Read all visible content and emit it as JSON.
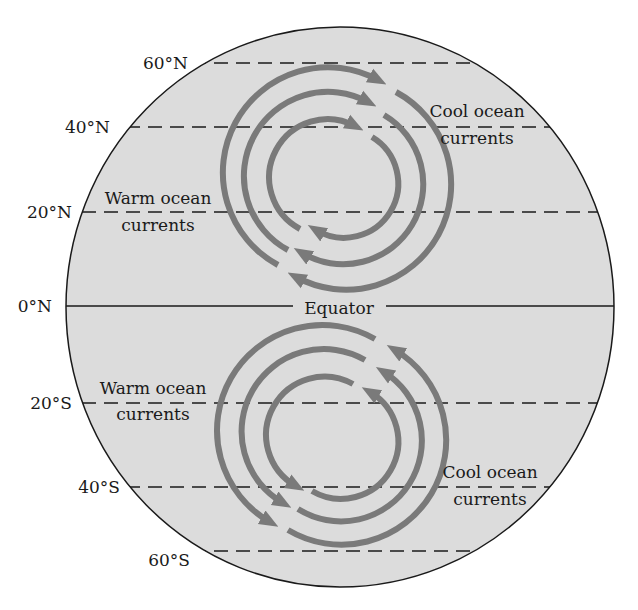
{
  "diagram": {
    "globe": {
      "fill": "#dcdcdc",
      "stroke": "#1a1a1a"
    },
    "arrow_color": "#7a7a7a",
    "latitudes": [
      {
        "label": "60°N",
        "y": 63
      },
      {
        "label": "40°N",
        "y": 127
      },
      {
        "label": "20°N",
        "y": 212
      },
      {
        "label": "0°N",
        "y": 306
      },
      {
        "label": "20°S",
        "y": 403
      },
      {
        "label": "40°S",
        "y": 487
      },
      {
        "label": "60°S",
        "y": 551
      }
    ],
    "equator_label": "Equator",
    "labels": {
      "north_warm_line1": "Warm ocean",
      "north_warm_line2": "currents",
      "north_cool_line1": "Cool ocean",
      "north_cool_line2": "currents",
      "south_warm_line1": "Warm ocean",
      "south_warm_line2": "currents",
      "south_cool_line1": "Cool ocean",
      "south_cool_line2": "currents"
    },
    "gyres": [
      {
        "hemisphere": "north",
        "rotation": "clockwise",
        "center": [
          330,
          175
        ],
        "radii": [
          102,
          78,
          53
        ]
      },
      {
        "hemisphere": "south",
        "rotation": "counterclockwise",
        "center": [
          330,
          440
        ],
        "radii": [
          102,
          78,
          55
        ]
      }
    ]
  }
}
